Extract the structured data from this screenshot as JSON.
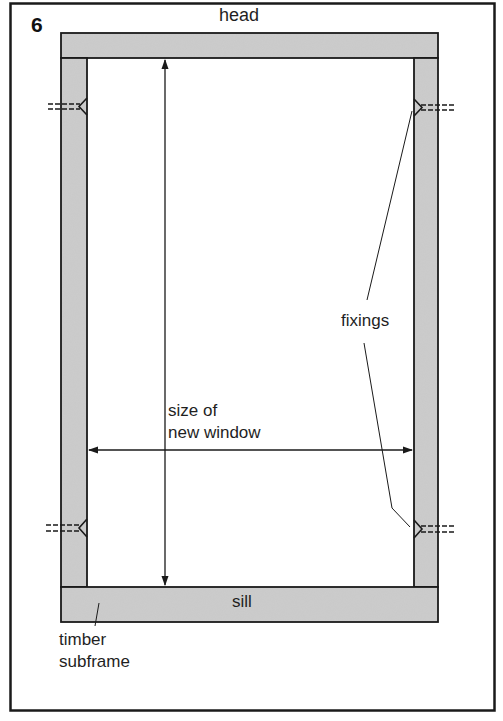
{
  "figure": {
    "number": "6",
    "labels": {
      "head": "head",
      "sill": "sill",
      "fixings": "fixings",
      "size_line1": "size of",
      "size_line2": "new window",
      "subframe_line1": "timber",
      "subframe_line2": "subframe"
    },
    "colors": {
      "timber_fill": "#c9c9c9",
      "outline": "#1a1a1a",
      "background": "#ffffff"
    },
    "components": [
      "outer-border",
      "head",
      "left-jamb",
      "right-jamb",
      "sill",
      "vertical-dimension-arrow",
      "horizontal-dimension-arrow",
      "fixing-top-left",
      "fixing-top-right",
      "fixing-bottom-left",
      "fixing-bottom-right"
    ]
  }
}
